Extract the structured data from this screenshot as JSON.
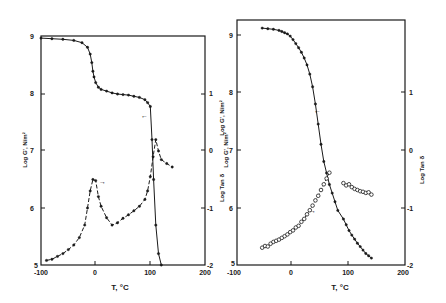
{
  "chart_data": [
    {
      "type": "line",
      "panel": "left",
      "title": "",
      "xlabel": "T, °C",
      "ylabel_left": "Log G', N/m²",
      "ylabel_right": "Log Tan δ",
      "xlim": [
        -100,
        200
      ],
      "ylim_left": [
        5,
        9
      ],
      "ylim_right": [
        -2,
        1
      ],
      "x_ticks": [
        "-100",
        "0",
        "100",
        "200"
      ],
      "y_ticks_left": [
        "5",
        "6",
        "7",
        "8",
        "9"
      ],
      "y_ticks_right": [
        "-2",
        "-1",
        "0",
        "1"
      ],
      "grid": false,
      "series": [
        {
          "name": "Log G'",
          "axis": "left",
          "style": "solid line with filled points",
          "x": [
            -100,
            -80,
            -60,
            -40,
            -25,
            -15,
            -10,
            -7,
            -5,
            -3,
            0,
            5,
            10,
            20,
            30,
            40,
            50,
            60,
            70,
            80,
            90,
            95,
            100,
            103,
            106,
            110,
            115,
            120
          ],
          "y": [
            8.98,
            8.97,
            8.96,
            8.94,
            8.9,
            8.82,
            8.7,
            8.55,
            8.4,
            8.3,
            8.2,
            8.12,
            8.08,
            8.05,
            8.02,
            8.0,
            7.99,
            7.98,
            7.96,
            7.94,
            7.9,
            7.85,
            7.78,
            7.2,
            6.5,
            5.7,
            5.2,
            5.0
          ]
        },
        {
          "name": "Log Tan δ",
          "axis": "right",
          "style": "dashed line with filled points",
          "x": [
            -90,
            -80,
            -70,
            -60,
            -50,
            -40,
            -30,
            -20,
            -15,
            -10,
            -5,
            0,
            5,
            10,
            20,
            30,
            40,
            50,
            60,
            70,
            80,
            90,
            95,
            100,
            105,
            110,
            115,
            120,
            130,
            140
          ],
          "y": [
            -1.92,
            -1.9,
            -1.85,
            -1.8,
            -1.73,
            -1.65,
            -1.52,
            -1.3,
            -1.0,
            -0.7,
            -0.5,
            -0.52,
            -0.8,
            -0.97,
            -1.17,
            -1.3,
            -1.26,
            -1.18,
            -1.12,
            -1.05,
            -0.97,
            -0.85,
            -0.7,
            -0.45,
            -0.1,
            0.2,
            0.0,
            -0.15,
            -0.22,
            -0.28
          ]
        }
      ],
      "annotations": [
        "arrow ← near G' curve (pointing to left axis)",
        "arrow → near tan δ peak (pointing to right axis)"
      ]
    },
    {
      "type": "scatter",
      "panel": "right",
      "title": "",
      "xlabel": "T, °C",
      "ylabel_left": "Log G', N/m²",
      "ylabel_right": "Log Tan δ",
      "xlim": [
        -100,
        200
      ],
      "ylim_left": [
        5,
        9
      ],
      "ylim_right": [
        -2,
        1
      ],
      "x_ticks": [
        "-100",
        "0",
        "100",
        "200"
      ],
      "y_ticks_left": [
        "5",
        "6",
        "7",
        "8",
        "9"
      ],
      "y_ticks_right": [
        "-2",
        "-1",
        "0",
        "1"
      ],
      "grid": false,
      "series": [
        {
          "name": "Log G'",
          "axis": "left",
          "style": "solid line with filled points",
          "x": [
            -55,
            -45,
            -35,
            -25,
            -20,
            -15,
            -10,
            -5,
            0,
            5,
            10,
            15,
            20,
            25,
            30,
            35,
            40,
            45,
            50,
            55,
            60,
            65,
            70,
            75,
            80,
            90,
            95,
            100,
            105,
            110,
            115,
            120,
            125,
            130,
            135,
            140
          ],
          "y": [
            9.12,
            9.11,
            9.1,
            9.08,
            9.06,
            9.04,
            9.02,
            8.98,
            8.92,
            8.85,
            8.78,
            8.7,
            8.6,
            8.48,
            8.32,
            8.1,
            7.8,
            7.45,
            7.1,
            6.8,
            6.6,
            6.4,
            6.25,
            6.1,
            5.95,
            5.8,
            5.7,
            5.6,
            5.52,
            5.45,
            5.38,
            5.32,
            5.26,
            5.2,
            5.16,
            5.12
          ]
        },
        {
          "name": "Log Tan δ (below Tg)",
          "axis": "right",
          "style": "open circles with dashed fit",
          "x": [
            -55,
            -50,
            -45,
            -40,
            -35,
            -30,
            -25,
            -20,
            -15,
            -10,
            -5,
            0,
            5,
            10,
            15,
            20,
            25,
            30,
            35,
            40,
            45,
            50,
            55,
            60,
            65
          ],
          "y": [
            -1.7,
            -1.67,
            -1.68,
            -1.63,
            -1.6,
            -1.58,
            -1.56,
            -1.53,
            -1.5,
            -1.47,
            -1.43,
            -1.4,
            -1.35,
            -1.32,
            -1.25,
            -1.2,
            -1.12,
            -1.05,
            -0.97,
            -0.88,
            -0.8,
            -0.7,
            -0.6,
            -0.5,
            -0.4
          ]
        },
        {
          "name": "Log Tan δ (above Tg)",
          "axis": "right",
          "style": "open circles with dashed fit",
          "x": [
            90,
            95,
            100,
            105,
            110,
            115,
            120,
            125,
            130,
            135,
            140
          ],
          "y": [
            -0.58,
            -0.62,
            -0.6,
            -0.65,
            -0.68,
            -0.7,
            -0.72,
            -0.73,
            -0.75,
            -0.74,
            -0.78
          ]
        }
      ],
      "annotations": [
        "arrow ← near G' curve (pointing to left axis)",
        "arrow → near tan δ curve (pointing to right axis)"
      ]
    }
  ],
  "left_panel": {
    "xlabel": "T, °C",
    "ylabel_left": "Log G', N/m²",
    "ylabel_right": "Log Tan δ",
    "x_ticks": [
      "-100",
      "0",
      "100",
      "200"
    ],
    "y_ticks_left": [
      "5",
      "6",
      "7",
      "8",
      "9"
    ],
    "y_ticks_right": [
      "-2",
      "-1",
      "0",
      "1"
    ],
    "arrow_g": "←",
    "arrow_tan": "→"
  },
  "right_panel": {
    "xlabel": "T, °C",
    "ylabel_left": "Log G', N/m²",
    "ylabel_right": "Log Tan δ",
    "x_ticks": [
      "-100",
      "0",
      "100",
      "200"
    ],
    "y_ticks_left": [
      "5",
      "6",
      "7",
      "8",
      "9"
    ],
    "y_ticks_right": [
      "-2",
      "-1",
      "0",
      "1"
    ],
    "arrow_g": "←",
    "arrow_tan": "→"
  },
  "colors": {
    "ink": "#1a1a1a",
    "background": "#ffffff"
  }
}
